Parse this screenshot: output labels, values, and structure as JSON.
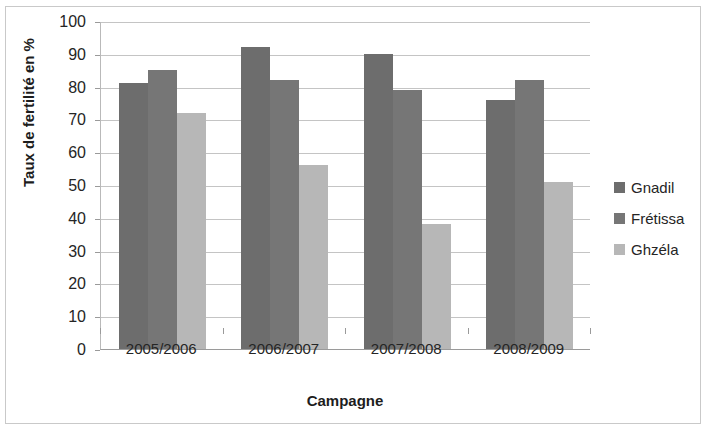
{
  "chart_data": {
    "type": "bar",
    "title": "",
    "subtitle": "",
    "xlabel": "Campagne",
    "ylabel": "Taux de fertilité en %",
    "categories": [
      "2005/2006",
      "2006/2007",
      "2007/2008",
      "2008/2009"
    ],
    "series": [
      {
        "name": "Gnadil",
        "color": "#6d6d6d",
        "values": [
          81,
          92,
          90,
          76
        ]
      },
      {
        "name": "Frétissa",
        "color": "#767676",
        "values": [
          85,
          82,
          79,
          82
        ]
      },
      {
        "name": "Ghzéla",
        "color": "#b7b7b7",
        "values": [
          72,
          56,
          38,
          51
        ]
      }
    ],
    "ylim": [
      0,
      100
    ],
    "ytick_step": 10,
    "yticks": [
      0,
      10,
      20,
      30,
      40,
      50,
      60,
      70,
      80,
      90,
      100
    ],
    "ytick_labels": [
      "0",
      "10",
      "20",
      "30",
      "40",
      "50",
      "60",
      "70",
      "80",
      "90",
      "100"
    ],
    "grid": "horizontal",
    "legend_position": "right",
    "bar_gap_within_group": 0,
    "background_color": "#ffffff",
    "gridline_color": "#c4c4c4",
    "axis_color": "#9a9a9a",
    "text_color": "#252525"
  }
}
